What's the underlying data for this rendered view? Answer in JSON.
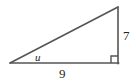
{
  "figure": {
    "type": "right-triangle-diagram",
    "stroke_color": "#555555",
    "label_color": "#231f20",
    "background_color": "#ffffff",
    "labels": {
      "angle": "u",
      "base": "9",
      "height": "7"
    },
    "vertices": {
      "left": {
        "x": 10,
        "y": 63
      },
      "bottom_right": {
        "x": 118,
        "y": 63
      },
      "top_right": {
        "x": 118,
        "y": 7
      }
    },
    "right_angle_marker": {
      "at_vertex": "bottom_right",
      "size": 7
    }
  }
}
